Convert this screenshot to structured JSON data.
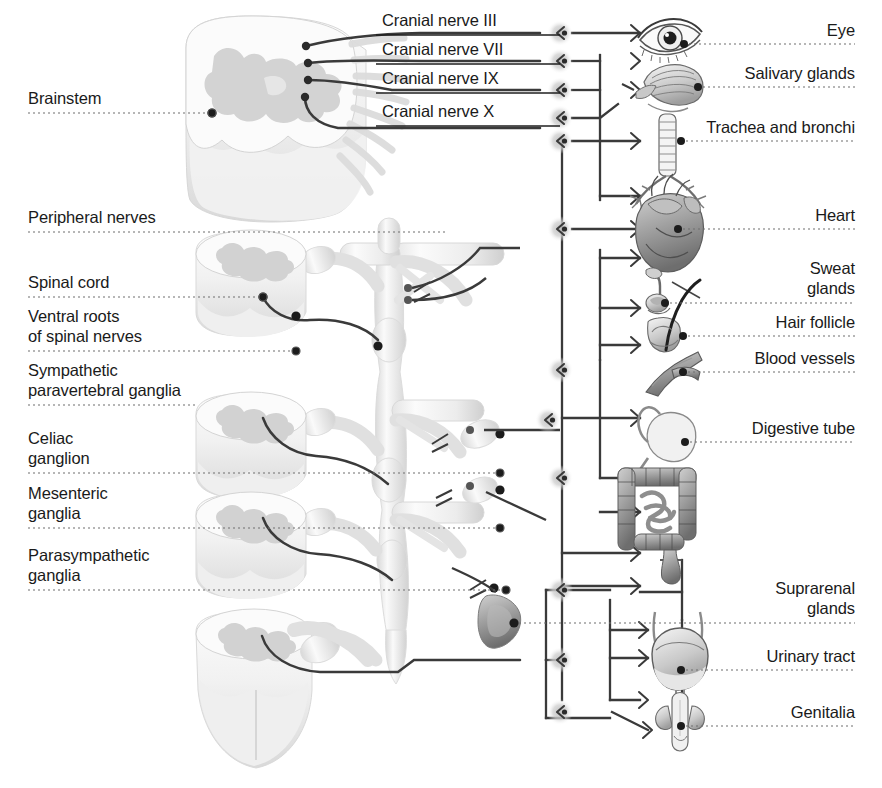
{
  "figure": {
    "type": "anatomical-diagram",
    "background_color": "#ffffff",
    "ink_color": "#1a1a1a",
    "leader_color": "#6e6e6e"
  },
  "left_labels": [
    {
      "id": "brainstem",
      "text": "Brainstem",
      "x": 28,
      "y": 88,
      "line_y": 113,
      "line_x2": 212,
      "dot": true
    },
    {
      "id": "peripheral-nerves",
      "text": "Peripheral nerves",
      "x": 28,
      "y": 207,
      "line_y": 232,
      "line_x2": 446,
      "dot": false
    },
    {
      "id": "spinal-cord",
      "text": "Spinal cord",
      "x": 28,
      "y": 272,
      "line_y": 297,
      "line_x2": 263,
      "dot": true
    },
    {
      "id": "ventral-roots",
      "text": "Ventral roots\nof spinal nerves",
      "x": 28,
      "y": 306,
      "line_y": 351,
      "line_x2": 296,
      "dot": true
    },
    {
      "id": "sympathetic-ganglia",
      "text": "Sympathetic\nparavertebral ganglia",
      "x": 28,
      "y": 360,
      "line_y": 405,
      "line_x2": 196,
      "dot": false
    },
    {
      "id": "celiac-ganglion",
      "text": "Celiac\nganglion",
      "x": 28,
      "y": 428,
      "line_y": 473,
      "line_x2": 500,
      "dot": true
    },
    {
      "id": "mesenteric-ganglia",
      "text": "Mesenteric\nganglia",
      "x": 28,
      "y": 483,
      "line_y": 528,
      "line_x2": 500,
      "dot": true
    },
    {
      "id": "parasympathetic-ganglia",
      "text": "Parasympathetic\nganglia",
      "x": 28,
      "y": 545,
      "line_y": 590,
      "line_x2": 506,
      "dot": true
    }
  ],
  "nerve_labels": [
    {
      "id": "cranial-nerve-3",
      "text": "Cranial nerve III",
      "x": 382,
      "y": 10,
      "line_y": 35
    },
    {
      "id": "cranial-nerve-7",
      "text": "Cranial nerve VII",
      "x": 382,
      "y": 39,
      "line_y": 64
    },
    {
      "id": "cranial-nerve-9",
      "text": "Cranial nerve IX",
      "x": 382,
      "y": 68,
      "line_y": 93
    },
    {
      "id": "cranial-nerve-10",
      "text": "Cranial nerve X",
      "x": 382,
      "y": 101,
      "line_y": 126
    }
  ],
  "organ_labels": [
    {
      "id": "eye",
      "text": "Eye",
      "y": 20,
      "line_y": 44,
      "dot_x": 684
    },
    {
      "id": "salivary-glands",
      "text": "Salivary glands",
      "y": 63,
      "line_y": 87,
      "dot_x": 698
    },
    {
      "id": "trachea-bronchi",
      "text": "Trachea and bronchi",
      "y": 117,
      "line_y": 141,
      "dot_x": 681
    },
    {
      "id": "heart",
      "text": "Heart",
      "y": 205,
      "line_y": 229,
      "dot_x": 678
    },
    {
      "id": "sweat-glands",
      "text": "Sweat\nglands",
      "y": 258,
      "line_y": 303,
      "dot_x": 665
    },
    {
      "id": "hair-follicle",
      "text": "Hair follicle",
      "y": 312,
      "line_y": 336,
      "dot_x": 683
    },
    {
      "id": "blood-vessels",
      "text": "Blood vessels",
      "y": 348,
      "line_y": 372,
      "dot_x": 683
    },
    {
      "id": "digestive-tube",
      "text": "Digestive tube",
      "y": 418,
      "line_y": 442,
      "dot_x": 685
    },
    {
      "id": "suprarenal-glands",
      "text": "Suprarenal\nglands",
      "y": 578,
      "line_y": 623,
      "dot_x": 514
    },
    {
      "id": "urinary-tract",
      "text": "Urinary tract",
      "y": 646,
      "line_y": 670,
      "dot_x": 681
    },
    {
      "id": "genitalia",
      "text": "Genitalia",
      "y": 702,
      "line_y": 726,
      "dot_x": 681
    }
  ],
  "label_right_edge": 855,
  "anatomy": {
    "brainstem": "brainstem-cross-section",
    "spinal_cord_sections": 4,
    "sympathetic_chain": "paravertebral-ganglion-chain",
    "suprarenal_gland": "suprarenal-gland-shape",
    "ganglion_marker": "parasympathetic-ganglion-icon"
  },
  "organs": {
    "eye": "eye-illustration",
    "salivary": "salivary-gland-illustration",
    "trachea": "trachea-bronchi-illustration",
    "heart": "heart-illustration",
    "sweat": "sweat-gland-illustration",
    "hair": "hair-follicle-illustration",
    "vessel": "blood-vessel-illustration",
    "stomach": "stomach-illustration",
    "intestine": "intestine-illustration",
    "bladder": "urinary-bladder-illustration",
    "genitalia": "genitalia-illustration"
  }
}
